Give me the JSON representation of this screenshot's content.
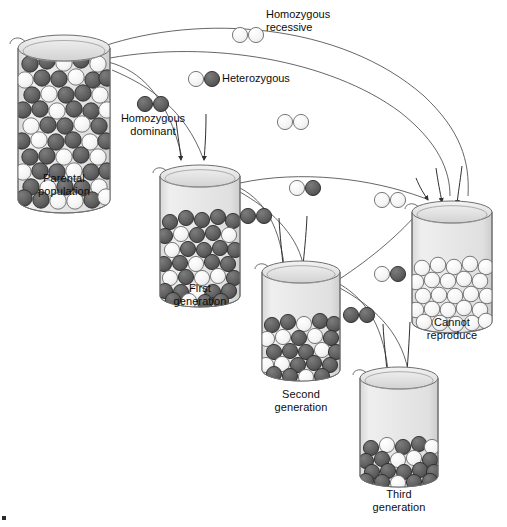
{
  "figure": {
    "title_visible": false,
    "background": "#ffffff",
    "colors": {
      "dominant_bead": "#5f5f5f",
      "dominant_bead_stroke": "#2c2c2c",
      "recessive_bead": "#f2f2f2",
      "recessive_bead_stroke": "#6b6b6b",
      "glass_fill": "#e9e9e9",
      "glass_stroke": "#6e6e6e",
      "arrow_stroke": "#3a3a3a",
      "text": "#0d0d0d"
    }
  },
  "legend": [
    {
      "id": "homozygous-recessive",
      "label": "Homozygous\nrecessive",
      "beads": [
        "recessive",
        "recessive"
      ]
    },
    {
      "id": "heterozygous",
      "label": "Heterozygous",
      "beads": [
        "recessive",
        "dominant"
      ]
    },
    {
      "id": "homozygous-dominant",
      "label": "Homozygous\ndominant",
      "beads": [
        "dominant",
        "dominant"
      ]
    }
  ],
  "beakers": [
    {
      "id": "parental-population",
      "label": "Parental\npopulation",
      "fill_level_pct": 92,
      "dominant_count": 44,
      "recessive_count": 28
    },
    {
      "id": "first-generation",
      "label": "First\ngeneration",
      "fill_level_pct": 62,
      "dominant_count": 36,
      "recessive_count": 14
    },
    {
      "id": "second-generation",
      "label": "Second\ngeneration",
      "fill_level_pct": 46,
      "dominant_count": 28,
      "recessive_count": 10
    },
    {
      "id": "third-generation",
      "label": "Third\ngeneration",
      "fill_level_pct": 32,
      "dominant_count": 22,
      "recessive_count": 6
    },
    {
      "id": "cannot-reproduce",
      "label": "Cannot\nreproduce",
      "fill_level_pct": 40,
      "dominant_count": 0,
      "recessive_count": 30
    }
  ],
  "bead_pairs": [
    {
      "id": "pair-hom-rec-top",
      "beads": [
        "recessive",
        "recessive"
      ]
    },
    {
      "id": "pair-het-upper",
      "beads": [
        "recessive",
        "dominant"
      ]
    },
    {
      "id": "pair-hom-dom-left",
      "beads": [
        "dominant",
        "dominant"
      ]
    },
    {
      "id": "pair-hom-rec-mid",
      "beads": [
        "recessive",
        "recessive"
      ]
    },
    {
      "id": "pair-het-mid",
      "beads": [
        "recessive",
        "dominant"
      ]
    },
    {
      "id": "pair-hom-rec-right",
      "beads": [
        "recessive",
        "recessive"
      ]
    },
    {
      "id": "pair-hom-dom-mid",
      "beads": [
        "dominant",
        "dominant"
      ]
    },
    {
      "id": "pair-het-right",
      "beads": [
        "recessive",
        "dominant"
      ]
    },
    {
      "id": "pair-hom-dom-right",
      "beads": [
        "dominant",
        "dominant"
      ]
    }
  ],
  "flow": {
    "arrows_into_first_generation": 2,
    "arrows_into_second_generation": 2,
    "arrows_into_third_generation": 2,
    "arrows_into_cannot_reproduce": 3
  }
}
